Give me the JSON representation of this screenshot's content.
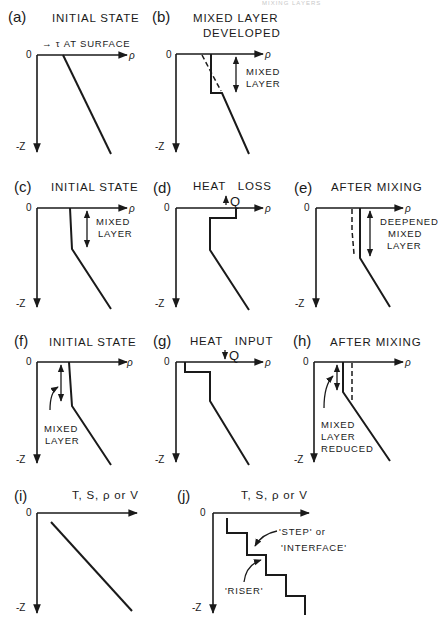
{
  "header": {
    "running_head": "MIXING LAYERS"
  },
  "axis_labels": {
    "origin": "0",
    "depth": "-Z",
    "density": "ρ",
    "generic": "T, S, ρ or V"
  },
  "panels": [
    {
      "id": "a",
      "label": "(a)",
      "title": [
        "INITIAL STATE"
      ],
      "annotation": [
        "→ τ AT SURFACE"
      ]
    },
    {
      "id": "b",
      "label": "(b)",
      "title": [
        "MIXED LAYER",
        "DEVELOPED"
      ],
      "annotation": [
        "MIXED",
        "LAYER"
      ]
    },
    {
      "id": "c",
      "label": "(c)",
      "title": [
        "INITIAL STATE"
      ],
      "annotation": [
        "MIXED",
        "LAYER"
      ]
    },
    {
      "id": "d",
      "label": "(d)",
      "title": [
        "HEAT   LOSS"
      ],
      "annotation": [
        "Q"
      ]
    },
    {
      "id": "e",
      "label": "(e)",
      "title": [
        "AFTER MIXING"
      ],
      "annotation": [
        "DEEPENED",
        "MIXED",
        "LAYER"
      ]
    },
    {
      "id": "f",
      "label": "(f)",
      "title": [
        "INITIAL STATE"
      ],
      "annotation": [
        "MIXED",
        "LAYER"
      ]
    },
    {
      "id": "g",
      "label": "(g)",
      "title": [
        "HEAT   INPUT"
      ],
      "annotation": [
        "Q"
      ]
    },
    {
      "id": "h",
      "label": "(h)",
      "title": [
        "AFTER MIXING"
      ],
      "annotation": [
        "MIXED",
        "LAYER",
        "REDUCED"
      ]
    },
    {
      "id": "i",
      "label": "(i)",
      "title": [
        "T, S, ρ or V"
      ],
      "annotation": []
    },
    {
      "id": "j",
      "label": "(j)",
      "title": [
        "T, S, ρ or V"
      ],
      "annotation": [
        "'STEP'  or",
        "'INTERFACE'",
        "'RISER'"
      ]
    }
  ]
}
